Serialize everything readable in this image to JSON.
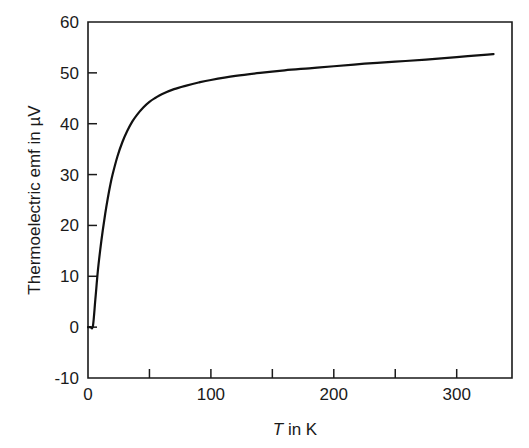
{
  "chart_data": {
    "type": "line",
    "title": "",
    "xlabel": "T in K",
    "xlabel_var": "T",
    "xlabel_rest": " in K",
    "ylabel": "Thermoelectric emf in µV",
    "xlim": [
      0,
      345
    ],
    "ylim": [
      -10,
      60
    ],
    "xticks": [
      0,
      100,
      200,
      300
    ],
    "xtick_labels": [
      "0",
      "100",
      "200",
      "300"
    ],
    "xminor_ticks": [
      50,
      150,
      250
    ],
    "yticks": [
      -10,
      0,
      10,
      20,
      30,
      40,
      50,
      60
    ],
    "ytick_labels": [
      "-10",
      "0",
      "10",
      "20",
      "30",
      "40",
      "50",
      "60"
    ],
    "grid": false,
    "legend": null,
    "series": [
      {
        "name": "Thermoelectric emf",
        "color": "#111111",
        "x": [
          0,
          2,
          4,
          6,
          8,
          10,
          12,
          14,
          16,
          18,
          20,
          24,
          28,
          32,
          36,
          40,
          45,
          50,
          55,
          60,
          70,
          80,
          90,
          100,
          120,
          140,
          160,
          180,
          200,
          225,
          250,
          275,
          300,
          325,
          330
        ],
        "y": [
          0.0,
          0.0,
          0.2,
          5.5,
          11.0,
          15.3,
          19.0,
          22.3,
          25.2,
          27.8,
          30.0,
          33.6,
          36.4,
          38.6,
          40.4,
          41.8,
          43.2,
          44.3,
          45.1,
          45.8,
          46.8,
          47.5,
          48.1,
          48.6,
          49.4,
          50.0,
          50.5,
          50.9,
          51.3,
          51.8,
          52.2,
          52.6,
          53.1,
          53.6,
          53.7
        ]
      }
    ]
  },
  "axes_geometry": {
    "left_px": 88,
    "right_px": 512,
    "top_px": 22,
    "bottom_px": 378
  }
}
